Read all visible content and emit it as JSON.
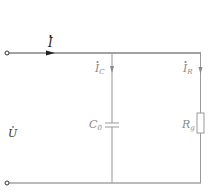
{
  "diagram": {
    "type": "circuit",
    "colors": {
      "main_wire": "#333333",
      "branch": "#9a9a9a",
      "label_dark": "#222222",
      "label_gray": "#8a8a8a"
    },
    "labels": {
      "source_current": {
        "main": "I",
        "sub": ""
      },
      "voltage": {
        "main": "U",
        "sub": ""
      },
      "cap_current": {
        "main": "I",
        "sub": "C"
      },
      "res_current": {
        "main": "I",
        "sub": "R"
      },
      "capacitor": {
        "main": "C",
        "sub": "0"
      },
      "resistor": {
        "main": "R",
        "sub": "g"
      }
    },
    "components": [
      {
        "id": "capacitor",
        "symbol": "capacitor",
        "label": "C0"
      },
      {
        "id": "resistor",
        "symbol": "resistor",
        "label": "Rg"
      }
    ],
    "terminals": [
      "top-terminal",
      "bottom-terminal"
    ]
  }
}
